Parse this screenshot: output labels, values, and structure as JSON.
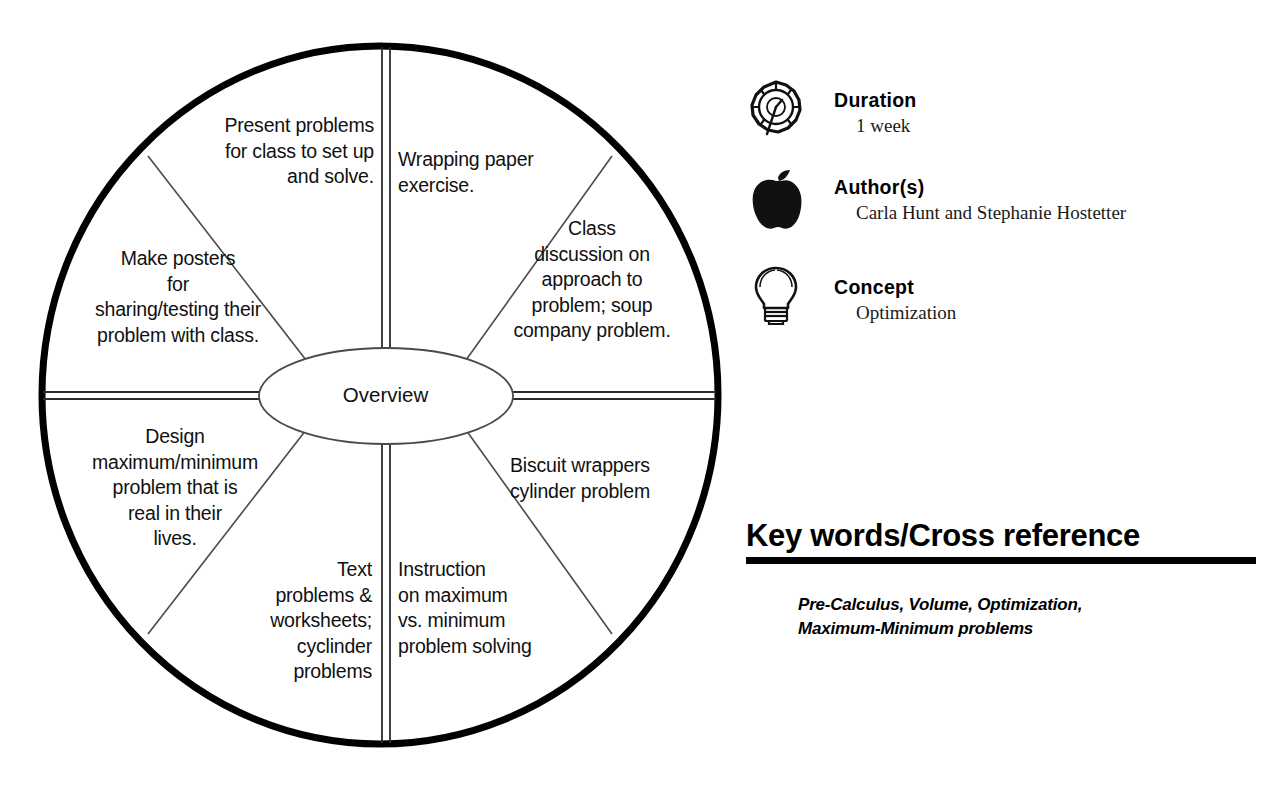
{
  "diagram": {
    "type": "cycle-wheel",
    "center_label": "Overview",
    "segments": [
      {
        "id": "present-problems",
        "position": "top-left",
        "text": "Present problems\nfor class to set up\nand solve."
      },
      {
        "id": "wrapping-paper",
        "position": "top-right",
        "text": "Wrapping paper\nexercise."
      },
      {
        "id": "class-discussion",
        "position": "upper-right",
        "text": "Class\ndiscussion on\napproach to\nproblem; soup\ncompany problem."
      },
      {
        "id": "biscuit-wrappers",
        "position": "lower-right",
        "text": "Biscuit wrappers\ncylinder problem"
      },
      {
        "id": "instruction-maxmin",
        "position": "bottom-right",
        "text": "Instruction\non maximum\nvs. minimum\nproblem solving"
      },
      {
        "id": "text-problems",
        "position": "bottom-left",
        "text": "Text\nproblems &\nworksheets;\ncyclinder\nproblems"
      },
      {
        "id": "design-maxmin",
        "position": "lower-left",
        "text": "Design\nmaximum/minimum\nproblem that is\nreal in their\nlives."
      },
      {
        "id": "make-posters",
        "position": "upper-left",
        "text": "Make posters\nfor\nsharing/testing their\nproblem with class."
      }
    ]
  },
  "meta": {
    "rows": [
      {
        "id": "duration",
        "icon": "clock-icon",
        "title": "Duration",
        "value": "1 week"
      },
      {
        "id": "authors",
        "icon": "apple-icon",
        "title": "Author(s)",
        "value": "Carla Hunt and Stephanie Hostetter"
      },
      {
        "id": "concept",
        "icon": "lightbulb-icon",
        "title": "Concept",
        "value": "Optimization"
      }
    ]
  },
  "keywords": {
    "heading": "Key words/Cross reference",
    "list": "Pre-Calculus, Volume, Optimization,\nMaximum-Minimum problems"
  },
  "colors": {
    "ink": "#000000",
    "rule": "#000000",
    "thin_line": "#4a4a4a",
    "background": "#ffffff"
  }
}
